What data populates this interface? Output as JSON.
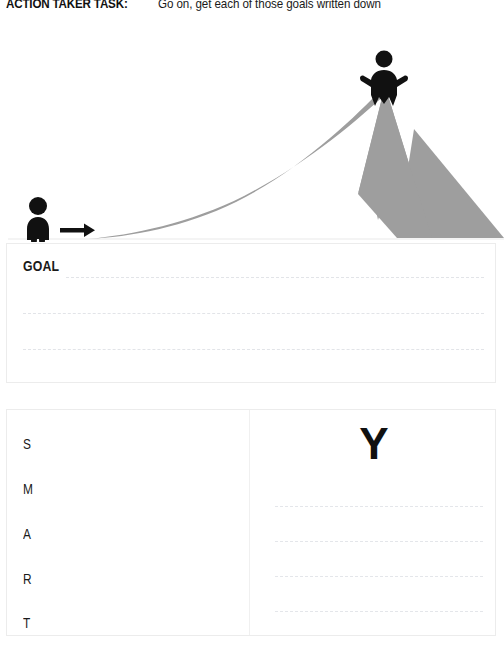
{
  "header": {
    "task_label": "ACTION TAKER TASK:",
    "task_text": "Go on, get each of those goals written down"
  },
  "illustration": {
    "name": "mountain-climb-illustration",
    "mountain_color": "#9e9e9e",
    "figure_color": "#111111",
    "baseline_color": "#f2f2f2",
    "start_figure": "person-standing-at-base",
    "direction_arrow": "right-arrow",
    "summit_figure": "person-celebrating-on-summit"
  },
  "goal_card": {
    "label": "GOAL",
    "lines": [
      "",
      "",
      ""
    ],
    "line_count": 3,
    "placeholder": ""
  },
  "bottom_card": {
    "smart": {
      "letters": [
        "S",
        "M",
        "A",
        "R",
        "T"
      ]
    },
    "why": {
      "heading": "Y",
      "lines": [
        "",
        "",
        "",
        ""
      ],
      "line_count": 4,
      "placeholder": ""
    }
  },
  "colors": {
    "card_border": "#ececec",
    "dashed_line": "#e3e5e9",
    "ink": "#1a1a1a",
    "mountain": "#9e9e9e"
  }
}
